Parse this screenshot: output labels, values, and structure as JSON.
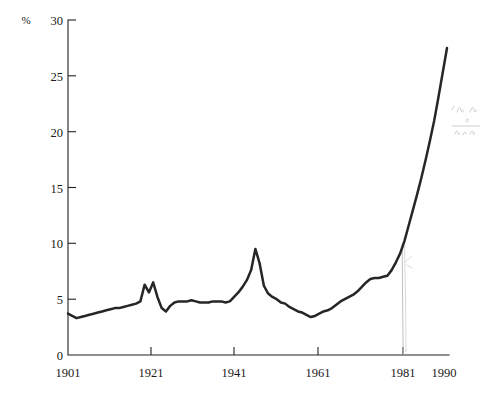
{
  "chart_data": {
    "type": "line",
    "title": "",
    "subtitle": "",
    "xlabel": "",
    "ylabel": "%",
    "unit_label": "%",
    "xlim": [
      1901,
      1990
    ],
    "ylim": [
      0,
      30
    ],
    "grid": false,
    "legend": "none",
    "x_tick_labels": [
      "1901",
      "1921",
      "1941",
      "1961",
      "1981",
      "1990"
    ],
    "x_ticks": [
      1901,
      1921,
      1941,
      1961,
      1981,
      1990
    ],
    "y_tick_labels": [
      "0",
      "5",
      "10",
      "15",
      "20",
      "25",
      "30"
    ],
    "y_ticks": [
      0,
      5,
      10,
      15,
      20,
      25,
      30
    ],
    "series": [
      {
        "name": "percentage",
        "x": [
          1901,
          1902,
          1903,
          1904,
          1905,
          1906,
          1907,
          1908,
          1909,
          1910,
          1911,
          1912,
          1913,
          1914,
          1915,
          1916,
          1917,
          1918,
          1919,
          1920,
          1921,
          1922,
          1923,
          1924,
          1925,
          1926,
          1927,
          1928,
          1929,
          1930,
          1931,
          1932,
          1933,
          1934,
          1935,
          1936,
          1937,
          1938,
          1939,
          1940,
          1941,
          1942,
          1943,
          1944,
          1945,
          1946,
          1947,
          1948,
          1949,
          1950,
          1951,
          1952,
          1953,
          1954,
          1955,
          1956,
          1957,
          1958,
          1959,
          1960,
          1961,
          1962,
          1963,
          1964,
          1965,
          1966,
          1967,
          1968,
          1969,
          1970,
          1971,
          1972,
          1973,
          1974,
          1975,
          1976,
          1977,
          1978,
          1979,
          1980,
          1981,
          1982,
          1983,
          1984,
          1985,
          1986,
          1987,
          1988,
          1989,
          1990
        ],
        "values": [
          3.7,
          3.5,
          3.3,
          3.4,
          3.5,
          3.6,
          3.7,
          3.8,
          3.9,
          4.0,
          4.1,
          4.2,
          4.2,
          4.3,
          4.4,
          4.5,
          4.6,
          4.8,
          6.3,
          5.6,
          6.5,
          5.2,
          4.2,
          3.9,
          4.4,
          4.7,
          4.8,
          4.8,
          4.8,
          4.9,
          4.8,
          4.7,
          4.7,
          4.7,
          4.8,
          4.8,
          4.8,
          4.7,
          4.8,
          5.2,
          5.6,
          6.1,
          6.7,
          7.6,
          9.5,
          8.2,
          6.2,
          5.5,
          5.2,
          5.0,
          4.7,
          4.6,
          4.3,
          4.1,
          3.9,
          3.8,
          3.6,
          3.4,
          3.5,
          3.7,
          3.9,
          4.0,
          4.2,
          4.5,
          4.8,
          5.0,
          5.2,
          5.4,
          5.7,
          6.1,
          6.5,
          6.8,
          6.9,
          6.9,
          7.0,
          7.1,
          7.6,
          8.3,
          9.1,
          10.2,
          11.6,
          13.0,
          14.4,
          15.9,
          17.5,
          19.2,
          21.0,
          23.1,
          25.3,
          27.5
        ]
      }
    ],
    "annotations": [
      {
        "name": "pencil-vertical-line",
        "x": 1981,
        "note": "faint hand-drawn vertical line"
      },
      {
        "name": "pencil-scribble",
        "note": "faint illegible handwriting, upper right"
      }
    ]
  },
  "axis": {
    "unit": "%"
  }
}
